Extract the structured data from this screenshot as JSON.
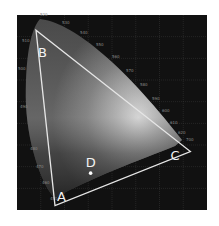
{
  "diagram": {
    "background_color": "#111111",
    "grid_color": "#3a3a3a",
    "triangle_color": "#e6e6e6",
    "vertices": [
      {
        "id": "A",
        "label": "A",
        "x": 0.16,
        "y": 0.02
      },
      {
        "id": "B",
        "label": "B",
        "x": 0.08,
        "y": 0.83
      },
      {
        "id": "C",
        "label": "C",
        "x": 0.73,
        "y": 0.27
      }
    ],
    "point": {
      "id": "D",
      "label": "D",
      "x": 0.31,
      "y": 0.17
    },
    "wavelength_labels": [
      "520",
      "530",
      "540",
      "550",
      "560",
      "570",
      "580",
      "590",
      "600",
      "610",
      "620",
      "700",
      "510",
      "500",
      "490",
      "480",
      "470",
      "460",
      "450"
    ],
    "axis": {
      "xlim": [
        0,
        0.8
      ],
      "ylim": [
        0,
        0.9
      ],
      "grid": true
    }
  }
}
